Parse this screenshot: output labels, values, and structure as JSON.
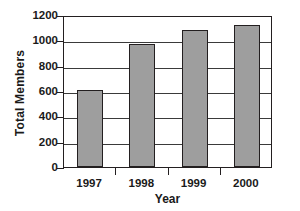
{
  "chart_data": {
    "type": "bar",
    "title": "",
    "subtitle": "",
    "xlabel": "Year",
    "ylabel": "Total Members",
    "categories": [
      "1997",
      "1998",
      "1999",
      "2000"
    ],
    "values": [
      605,
      970,
      1085,
      1120
    ],
    "series": [
      {
        "name": "Total Members",
        "values": [
          605,
          970,
          1085,
          1120
        ]
      }
    ],
    "ylim": [
      0,
      1200
    ],
    "ytick_step": 200,
    "yticks": [
      0,
      200,
      400,
      600,
      800,
      1000,
      1200
    ],
    "ytick_labels": [
      "0",
      "200",
      "400",
      "600",
      "800",
      "1000",
      "1200"
    ],
    "grid": true,
    "grid_axis": "y",
    "legend": false,
    "legend_position": "none",
    "annotations": [],
    "colors": {
      "bar_fill": "#9e9e9e",
      "bar_border": "#231f20",
      "axis": "#231f20",
      "gridline": "#3a3a3a",
      "background": "#ffffff",
      "text": "#1a1a1a"
    }
  }
}
